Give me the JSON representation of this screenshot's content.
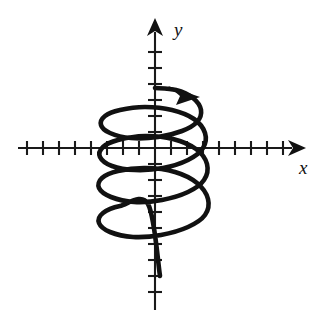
{
  "figure": {
    "background_color": "#ffffff",
    "ink_color": "#111111",
    "width": 324,
    "height": 333
  },
  "axes": {
    "origin": {
      "x": 155,
      "y": 148
    },
    "tick_spacing": 16,
    "x_axis": {
      "label": "x",
      "label_position": {
        "x": 299,
        "y": 174
      },
      "start_x": 18,
      "end_x": 301,
      "arrow_direction": "right",
      "tick_half_length": 7,
      "tick_positions": [
        27,
        43,
        59,
        75,
        91,
        107,
        123,
        139,
        171,
        187,
        203,
        219,
        235,
        251,
        267,
        283
      ]
    },
    "y_axis": {
      "label": "y",
      "label_position": {
        "x": 174,
        "y": 36
      },
      "start_y": 310,
      "end_y": 22,
      "arrow_direction": "up",
      "tick_half_length": 7,
      "tick_positions": [
        52,
        68,
        84,
        100,
        116,
        132,
        164,
        180,
        196,
        212,
        228,
        244,
        260,
        276,
        292
      ]
    }
  },
  "curve": {
    "name": "spiral-curve",
    "stroke_width": 4.6,
    "description": "Open spiral of four counterclockwise loops descending from the upper y-axis to the lower left",
    "start_point": {
      "x": 155,
      "y": 88
    },
    "end_point": {
      "x": 160,
      "y": 276
    },
    "left_extreme_x": 100,
    "right_extreme_x": 209,
    "arrowhead": {
      "name": "curve-direction-arrowhead",
      "tip": {
        "x": 196,
        "y": 96
      },
      "direction": "right-downward"
    },
    "path": "M 155 88 C 172 90, 190 95, 202 106 C 214 118, 210 132, 193 141 C 172 152, 140 155, 118 148 C 101 143, 99 133, 113 126 C 130 117, 156 112, 180 113 C 200 114, 210 122, 210 133"
  },
  "chart_data": {
    "type": "line",
    "title": "",
    "xlabel": "x",
    "ylabel": "y",
    "grid": false,
    "legend": null,
    "axis_units_visible": false,
    "x_tick_count": 16,
    "y_tick_count": 15,
    "series": [
      {
        "name": "spiral",
        "points": [
          [
            155,
            88
          ],
          [
            176,
            90
          ],
          [
            193,
            98
          ],
          [
            201,
            110
          ],
          [
            197,
            122
          ],
          [
            182,
            131
          ],
          [
            158,
            137
          ],
          [
            131,
            138
          ],
          [
            110,
            133
          ],
          [
            101,
            125
          ],
          [
            105,
            116
          ],
          [
            120,
            110
          ],
          [
            145,
            107
          ],
          [
            172,
            110
          ],
          [
            194,
            119
          ],
          [
            205,
            133
          ],
          [
            203,
            148
          ],
          [
            188,
            160
          ],
          [
            163,
            168
          ],
          [
            135,
            170
          ],
          [
            112,
            166
          ],
          [
            100,
            157
          ],
          [
            103,
            147
          ],
          [
            118,
            140
          ],
          [
            145,
            136
          ],
          [
            173,
            139
          ],
          [
            196,
            149
          ],
          [
            207,
            164
          ],
          [
            204,
            180
          ],
          [
            188,
            192
          ],
          [
            162,
            200
          ],
          [
            134,
            202
          ],
          [
            111,
            197
          ],
          [
            99,
            188
          ],
          [
            102,
            178
          ],
          [
            118,
            171
          ],
          [
            146,
            168
          ],
          [
            175,
            172
          ],
          [
            197,
            183
          ],
          [
            208,
            199
          ],
          [
            205,
            215
          ],
          [
            188,
            227
          ],
          [
            161,
            235
          ],
          [
            133,
            237
          ],
          [
            110,
            232
          ],
          [
            99,
            223
          ],
          [
            103,
            213
          ],
          [
            120,
            206
          ],
          [
            148,
            204
          ],
          [
            160,
            276
          ]
        ]
      }
    ]
  }
}
